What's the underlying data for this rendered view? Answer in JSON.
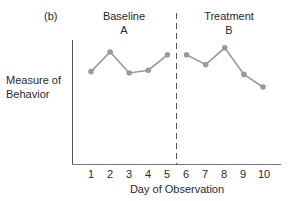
{
  "panel_label": "(b)",
  "phases": [
    {
      "title": "Baseline",
      "letter": "A"
    },
    {
      "title": "Treatment",
      "letter": "B"
    }
  ],
  "ylabel_lines": [
    "Measure of",
    "Behavior"
  ],
  "xlabel": "Day of Observation",
  "chart_data": {
    "type": "line",
    "title": "",
    "panel": "(b)",
    "xlabel": "Day of Observation",
    "ylabel": "Measure of Behavior",
    "x": [
      1,
      2,
      3,
      4,
      5,
      6,
      7,
      8,
      9,
      10
    ],
    "x_tick_labels": [
      "1",
      "2",
      "3",
      "4",
      "5",
      "6",
      "7",
      "8",
      "9",
      "10"
    ],
    "y_ticks": [],
    "phase_change_after_x": 5,
    "phase_labels": [
      "Baseline A",
      "Treatment B"
    ],
    "series": [
      {
        "name": "Baseline A",
        "x": [
          1,
          2,
          3,
          4,
          5
        ],
        "values": [
          66,
          80,
          65,
          67,
          78
        ]
      },
      {
        "name": "Treatment B",
        "x": [
          6,
          7,
          8,
          9,
          10
        ],
        "values": [
          78,
          71,
          83,
          64,
          55
        ]
      }
    ],
    "ylim": [
      0,
      100
    ],
    "grid": false,
    "legend": "none",
    "colors": {
      "line": "#9a9a9a",
      "marker": "#9a9a9a",
      "axis": "#555555"
    }
  }
}
